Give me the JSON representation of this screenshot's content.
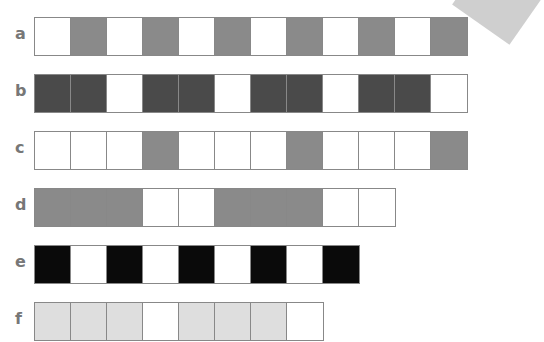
{
  "title_fragment": "",
  "colors": {
    "white": "#ffffff",
    "mid_gray": "#8a8a8a",
    "dark_gray": "#4a4a4a",
    "black": "#0a0a0a",
    "light_gray": "#dedede"
  },
  "rows": [
    {
      "label": "a",
      "top": 17,
      "cells": [
        "white",
        "mid_gray",
        "white",
        "mid_gray",
        "white",
        "mid_gray",
        "white",
        "mid_gray",
        "white",
        "mid_gray",
        "white",
        "mid_gray"
      ]
    },
    {
      "label": "b",
      "top": 74,
      "cells": [
        "dark_gray",
        "dark_gray",
        "white",
        "dark_gray",
        "dark_gray",
        "white",
        "dark_gray",
        "dark_gray",
        "white",
        "dark_gray",
        "dark_gray",
        "white"
      ]
    },
    {
      "label": "c",
      "top": 131,
      "cells": [
        "white",
        "white",
        "white",
        "mid_gray",
        "white",
        "white",
        "white",
        "mid_gray",
        "white",
        "white",
        "white",
        "mid_gray"
      ]
    },
    {
      "label": "d",
      "top": 188,
      "cells": [
        "mid_gray",
        "mid_gray",
        "mid_gray",
        "white",
        "white",
        "mid_gray",
        "mid_gray",
        "mid_gray",
        "white",
        "white"
      ]
    },
    {
      "label": "e",
      "top": 245,
      "cells": [
        "black",
        "white",
        "black",
        "white",
        "black",
        "white",
        "black",
        "white",
        "black"
      ]
    },
    {
      "label": "f",
      "top": 302,
      "cells": [
        "light_gray",
        "light_gray",
        "light_gray",
        "white",
        "light_gray",
        "light_gray",
        "light_gray",
        "white"
      ]
    }
  ]
}
